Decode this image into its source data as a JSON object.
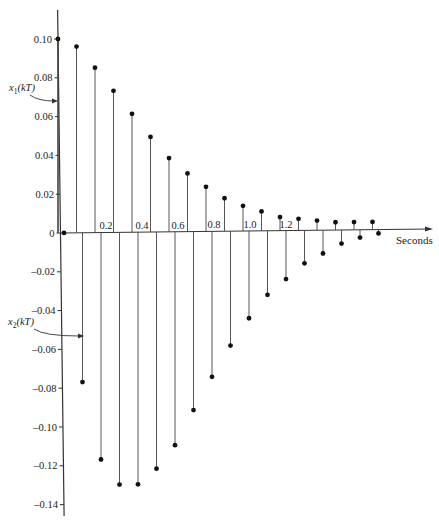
{
  "chart_data": {
    "type": "stem",
    "title": "",
    "xlabel": "Seconds",
    "ylabel": "",
    "xlim": [
      0,
      2.0
    ],
    "ylim": [
      -0.14,
      0.1
    ],
    "grid": false,
    "legend": "none (inline arrow annotations)",
    "x_ticks": [
      {
        "value": 0.2,
        "label": "0.2"
      },
      {
        "value": 0.4,
        "label": "0.4"
      },
      {
        "value": 0.6,
        "label": "0.6"
      },
      {
        "value": 0.8,
        "label": "0.8"
      },
      {
        "value": 1.0,
        "label": "1.0"
      },
      {
        "value": 1.2,
        "label": "1.2"
      }
    ],
    "y_ticks": [
      {
        "value": 0.1,
        "label": "0.10"
      },
      {
        "value": 0.08,
        "label": "0.08"
      },
      {
        "value": 0.06,
        "label": "0.06"
      },
      {
        "value": 0.04,
        "label": "0.04"
      },
      {
        "value": 0.02,
        "label": "0.02"
      },
      {
        "value": 0.0,
        "label": "0"
      },
      {
        "value": -0.02,
        "label": "-0.02"
      },
      {
        "value": -0.04,
        "label": "-0.04"
      },
      {
        "value": -0.06,
        "label": "-0.06"
      },
      {
        "value": -0.08,
        "label": "-0.08"
      },
      {
        "value": -0.1,
        "label": "-0.10"
      },
      {
        "value": -0.12,
        "label": "-0.12"
      },
      {
        "value": -0.14,
        "label": "-0.14"
      }
    ],
    "series": [
      {
        "name": "x1(kT)",
        "label_main": "x",
        "label_sub": "1",
        "label_rest": "(kT)",
        "x": [
          0.0,
          0.1,
          0.2,
          0.3,
          0.4,
          0.5,
          0.6,
          0.7,
          0.8,
          0.9,
          1.0,
          1.1,
          1.2,
          1.3,
          1.4,
          1.5,
          1.6,
          1.7
        ],
        "values": [
          0.1,
          0.096,
          0.085,
          0.073,
          0.061,
          0.049,
          0.038,
          0.03,
          0.023,
          0.017,
          0.013,
          0.01,
          0.007,
          0.006,
          0.005,
          0.004,
          0.004,
          0.004
        ]
      },
      {
        "name": "x2(kT)",
        "label_main": "x",
        "label_sub": "2",
        "label_rest": "(kT)",
        "x": [
          0.0,
          0.1,
          0.2,
          0.3,
          0.4,
          0.5,
          0.6,
          0.7,
          0.8,
          0.9,
          1.0,
          1.1,
          1.2,
          1.3,
          1.4,
          1.5,
          1.6,
          1.7
        ],
        "values": [
          0.0,
          -0.077,
          -0.117,
          -0.13,
          -0.13,
          -0.122,
          -0.11,
          -0.092,
          -0.075,
          -0.059,
          -0.045,
          -0.033,
          -0.025,
          -0.017,
          -0.012,
          -0.007,
          -0.004,
          -0.002
        ]
      }
    ]
  },
  "layout": {
    "axis_x_px": 58,
    "zero_y_px": 233,
    "px_per_unit_y": 1940,
    "x1_start_px": 58,
    "x2_start_px": 64,
    "px_per_sample": 18.5,
    "x_label_start_px": 106,
    "px_per_0_2_sec": 36
  }
}
